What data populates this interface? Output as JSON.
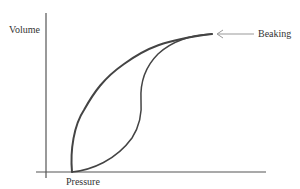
{
  "diagram": {
    "y_axis_label": "Volume",
    "x_axis_label": "Pressure",
    "annotation_label": "Beaking",
    "colors": {
      "curves": "#444444",
      "axes": "#555555",
      "arrow": "#999999",
      "text": "#333333"
    },
    "curves": [
      {
        "name": "upper-curve",
        "description": "Rises steeply from baseline then flattens to the beaking point"
      },
      {
        "name": "lower-curve",
        "description": "Rises slowly from baseline, inflects, then meets upper curve at the beaking point"
      }
    ]
  }
}
